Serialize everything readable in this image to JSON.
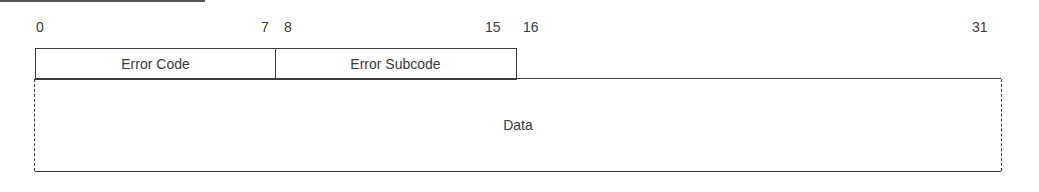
{
  "diagram": {
    "type": "packet-format",
    "bit_labels": [
      {
        "label": "0",
        "x": 36
      },
      {
        "label": "7",
        "x": 261
      },
      {
        "label": "8",
        "x": 284
      },
      {
        "label": "15",
        "x": 485
      },
      {
        "label": "16",
        "x": 523
      },
      {
        "label": "31",
        "x": 972
      }
    ],
    "fields": [
      {
        "name": "Error Code",
        "bits": "0-7"
      },
      {
        "name": "Error Subcode",
        "bits": "8-15"
      },
      {
        "name": "Data",
        "bits": "variable"
      }
    ]
  }
}
